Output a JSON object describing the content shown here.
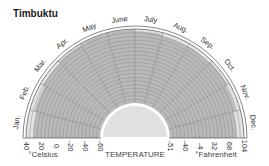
{
  "title": "Timbuktu",
  "chart_data": {
    "type": "radial-bar",
    "title": "Timbuktu",
    "xlabel": "TEMPERATURE",
    "categories": [
      "Jan.",
      "Feb.",
      "Mar.",
      "Apr.",
      "May",
      "June",
      "July",
      "Aug.",
      "Sep.",
      "Oct.",
      "Nov.",
      "Dec."
    ],
    "series": [
      {
        "name": "Max temperature (°C)",
        "values": [
          30,
          33,
          36,
          38,
          39,
          39,
          37,
          35,
          36,
          37,
          34,
          30
        ]
      }
    ],
    "celsius_ticks": [
      "40",
      "20",
      "0",
      "-20",
      "-40",
      "-60"
    ],
    "fahrenheit_ticks": [
      "-51",
      "-40",
      "-4",
      "32",
      "68",
      "104"
    ],
    "celsius_label": "°Celsius",
    "fahrenheit_label": "°Fahrenheit",
    "range_c": [
      -60,
      40
    ],
    "grid": true
  },
  "labels": {
    "celsius": "°Celsius",
    "temperature": "TEMPERATURE",
    "fahrenheit": "°Fahrenheit"
  },
  "colors": {
    "band": "#b9b9b9",
    "band_light": "#e3e3e3",
    "grid": "#8a8a8a",
    "frame": "#555555",
    "center": "#e0e0e0"
  }
}
